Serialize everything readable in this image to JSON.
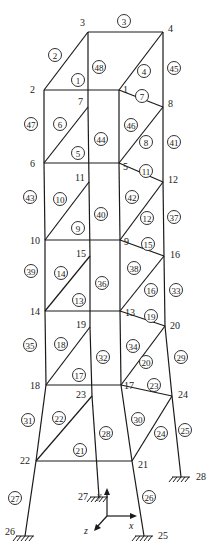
{
  "diagram": {
    "colors": {
      "line": "#1a1a1a",
      "background": "#ffffff"
    },
    "nodes": [
      {
        "id": "1",
        "x": 119,
        "y": 90,
        "lx": 123,
        "ly": 93
      },
      {
        "id": "2",
        "x": 44,
        "y": 90,
        "lx": 30,
        "ly": 93
      },
      {
        "id": "3",
        "x": 88,
        "y": 32,
        "lx": 80,
        "ly": 26
      },
      {
        "id": "4",
        "x": 163,
        "y": 32,
        "lx": 168,
        "ly": 32
      },
      {
        "id": "5",
        "x": 119,
        "y": 163,
        "lx": 123,
        "ly": 170
      },
      {
        "id": "6",
        "x": 44,
        "y": 163,
        "lx": 30,
        "ly": 167
      },
      {
        "id": "7",
        "x": 88,
        "y": 107,
        "lx": 78,
        "ly": 105
      },
      {
        "id": "8",
        "x": 163,
        "y": 107,
        "lx": 168,
        "ly": 107
      },
      {
        "id": "9",
        "x": 120,
        "y": 240,
        "lx": 124,
        "ly": 245
      },
      {
        "id": "10",
        "x": 45,
        "y": 240,
        "lx": 30,
        "ly": 244
      },
      {
        "id": "11",
        "x": 89,
        "y": 182,
        "lx": 75,
        "ly": 181
      },
      {
        "id": "12",
        "x": 163,
        "y": 182,
        "lx": 168,
        "ly": 183
      },
      {
        "id": "13",
        "x": 120,
        "y": 311,
        "lx": 125,
        "ly": 316
      },
      {
        "id": "14",
        "x": 45,
        "y": 311,
        "lx": 30,
        "ly": 315
      },
      {
        "id": "15",
        "x": 90,
        "y": 256,
        "lx": 76,
        "ly": 257
      },
      {
        "id": "16",
        "x": 164,
        "y": 256,
        "lx": 170,
        "ly": 258
      },
      {
        "id": "17",
        "x": 121,
        "y": 385,
        "lx": 124,
        "ly": 389
      },
      {
        "id": "18",
        "x": 46,
        "y": 385,
        "lx": 30,
        "ly": 389
      },
      {
        "id": "19",
        "x": 90,
        "y": 327,
        "lx": 76,
        "ly": 328
      },
      {
        "id": "20",
        "x": 165,
        "y": 326,
        "lx": 170,
        "ly": 329
      },
      {
        "id": "21",
        "x": 132,
        "y": 461,
        "lx": 138,
        "ly": 468
      },
      {
        "id": "22",
        "x": 36,
        "y": 461,
        "lx": 20,
        "ly": 464
      },
      {
        "id": "23",
        "x": 92,
        "y": 396,
        "lx": 76,
        "ly": 398
      },
      {
        "id": "24",
        "x": 172,
        "y": 396,
        "lx": 178,
        "ly": 398
      },
      {
        "id": "25",
        "x": 144,
        "y": 536,
        "lx": 158,
        "ly": 539
      },
      {
        "id": "26",
        "x": 25,
        "y": 536,
        "lx": 5,
        "ly": 535
      },
      {
        "id": "27",
        "x": 99,
        "y": 497,
        "lx": 78,
        "ly": 500
      },
      {
        "id": "28",
        "x": 181,
        "y": 477,
        "lx": 196,
        "ly": 480
      }
    ],
    "members": [
      {
        "id": "1",
        "a": "2",
        "b": "1",
        "cx": 78,
        "cy": 80
      },
      {
        "id": "2",
        "a": "2",
        "b": "3",
        "cx": 55,
        "cy": 55
      },
      {
        "id": "3",
        "a": "3",
        "b": "4",
        "cx": 124,
        "cy": 21
      },
      {
        "id": "4",
        "a": "1",
        "b": "4",
        "cx": 144,
        "cy": 71
      },
      {
        "id": "5",
        "a": "6",
        "b": "5",
        "cx": 78,
        "cy": 153
      },
      {
        "id": "6",
        "a": "6",
        "b": "7",
        "cx": 60,
        "cy": 124
      },
      {
        "id": "7",
        "a": "5",
        "b": "8",
        "cx": 142,
        "cy": 96
      },
      {
        "id": "8",
        "a": "1",
        "b": "8",
        "cx": 146,
        "cy": 142
      },
      {
        "id": "9",
        "a": "10",
        "b": "9",
        "cx": 78,
        "cy": 228
      },
      {
        "id": "10",
        "a": "10",
        "b": "11",
        "cx": 60,
        "cy": 199
      },
      {
        "id": "11",
        "a": "5",
        "b": "12",
        "cx": 146,
        "cy": 171
      },
      {
        "id": "12",
        "a": "9",
        "b": "12",
        "cx": 147,
        "cy": 218
      },
      {
        "id": "13",
        "a": "14",
        "b": "13",
        "cx": 79,
        "cy": 300
      },
      {
        "id": "14",
        "a": "14",
        "b": "15",
        "cx": 61,
        "cy": 273
      },
      {
        "id": "15",
        "a": "9",
        "b": "16",
        "cx": 148,
        "cy": 244
      },
      {
        "id": "16",
        "a": "13",
        "b": "16",
        "cx": 151,
        "cy": 290
      },
      {
        "id": "17",
        "a": "18",
        "b": "17",
        "cx": 79,
        "cy": 375
      },
      {
        "id": "18",
        "a": "18",
        "b": "19",
        "cx": 61,
        "cy": 344
      },
      {
        "id": "19",
        "a": "13",
        "b": "20",
        "cx": 151,
        "cy": 316
      },
      {
        "id": "20",
        "a": "17",
        "b": "20",
        "cx": 146,
        "cy": 362
      },
      {
        "id": "21",
        "a": "22",
        "b": "21",
        "cx": 80,
        "cy": 450
      },
      {
        "id": "22",
        "a": "22",
        "b": "23",
        "cx": 59,
        "cy": 418
      },
      {
        "id": "23",
        "a": "17",
        "b": "24",
        "cx": 154,
        "cy": 385
      },
      {
        "id": "24",
        "a": "21",
        "b": "24",
        "cx": 161,
        "cy": 433
      },
      {
        "id": "25",
        "a": "24",
        "b": "28",
        "cx": 185,
        "cy": 430
      },
      {
        "id": "26",
        "a": "21",
        "b": "25",
        "cx": 149,
        "cy": 497
      },
      {
        "id": "27",
        "a": "22",
        "b": "26",
        "cx": 15,
        "cy": 498
      },
      {
        "id": "28",
        "a": "23",
        "b": "27",
        "cx": 106,
        "cy": 433
      },
      {
        "id": "29",
        "a": "20",
        "b": "24",
        "cx": 181,
        "cy": 357
      },
      {
        "id": "30",
        "a": "17",
        "b": "21",
        "cx": 138,
        "cy": 419
      },
      {
        "id": "31",
        "a": "18",
        "b": "22",
        "cx": 28,
        "cy": 420
      },
      {
        "id": "32",
        "a": "19",
        "b": "23",
        "cx": 103,
        "cy": 357
      },
      {
        "id": "33",
        "a": "16",
        "b": "20",
        "cx": 176,
        "cy": 290
      },
      {
        "id": "34",
        "a": "13",
        "b": "17",
        "cx": 133,
        "cy": 346
      },
      {
        "id": "35",
        "a": "14",
        "b": "18",
        "cx": 30,
        "cy": 345
      },
      {
        "id": "36",
        "a": "15",
        "b": "19",
        "cx": 102,
        "cy": 283
      },
      {
        "id": "37",
        "a": "12",
        "b": "16",
        "cx": 174,
        "cy": 217
      },
      {
        "id": "38",
        "a": "9",
        "b": "13",
        "cx": 134,
        "cy": 268
      },
      {
        "id": "39",
        "a": "10",
        "b": "14",
        "cx": 31,
        "cy": 271
      },
      {
        "id": "40",
        "a": "11",
        "b": "15",
        "cx": 101,
        "cy": 214
      },
      {
        "id": "41",
        "a": "8",
        "b": "12",
        "cx": 174,
        "cy": 142
      },
      {
        "id": "42",
        "a": "5",
        "b": "9",
        "cx": 132,
        "cy": 197
      },
      {
        "id": "43",
        "a": "6",
        "b": "10",
        "cx": 30,
        "cy": 197
      },
      {
        "id": "44",
        "a": "7",
        "b": "11",
        "cx": 101,
        "cy": 139
      },
      {
        "id": "45",
        "a": "4",
        "b": "8",
        "cx": 174,
        "cy": 68
      },
      {
        "id": "46",
        "a": "1",
        "b": "5",
        "cx": 131,
        "cy": 125
      },
      {
        "id": "47",
        "a": "2",
        "b": "6",
        "cx": 31,
        "cy": 124
      },
      {
        "id": "48",
        "a": "3",
        "b": "7",
        "cx": 99,
        "cy": 67
      }
    ],
    "extra_lines": [
      {
        "a": "2",
        "b": "7"
      },
      {
        "a": "1",
        "b": "5"
      }
    ],
    "supports": [
      "25",
      "26",
      "27",
      "28"
    ],
    "axes": {
      "origin": {
        "x": 107,
        "y": 516
      },
      "x_label": "x",
      "y_label": "y",
      "z_label": "z"
    }
  }
}
